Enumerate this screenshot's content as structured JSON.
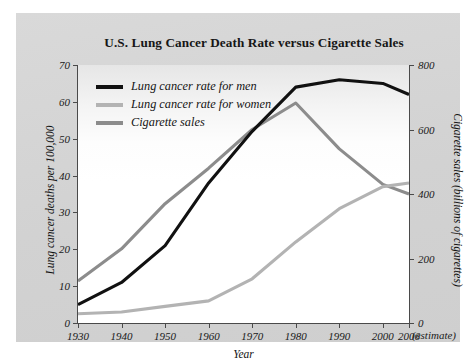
{
  "chart_data": {
    "type": "line",
    "title": "U.S. Lung Cancer Death Rate versus Cigarette Sales",
    "xlabel": "Year",
    "ylabel": "Lung cancer deaths per 100,000",
    "ylabel_right": "Cigarette sales (billions of cigarettes)",
    "x_tick_labels": [
      "1930",
      "1940",
      "1950",
      "1960",
      "1970",
      "1980",
      "1990",
      "2000",
      "2006"
    ],
    "x_estimate_note": "(estimate)",
    "x": [
      1930,
      1940,
      1950,
      1960,
      1970,
      1980,
      1990,
      2000,
      2006
    ],
    "xlim": [
      1930,
      2006
    ],
    "ylim": [
      0,
      70
    ],
    "y_tick_labels": [
      "0",
      "10",
      "20",
      "30",
      "40",
      "50",
      "60",
      "70"
    ],
    "y_ticks": [
      0,
      10,
      20,
      30,
      40,
      50,
      60,
      70
    ],
    "ylim_right": [
      0,
      800
    ],
    "y_right_tick_labels": [
      "0",
      "200",
      "400",
      "600",
      "800"
    ],
    "y_right_ticks": [
      0,
      200,
      400,
      600,
      800
    ],
    "grid": false,
    "legend_position": "upper-left-inside",
    "series": [
      {
        "name": "Lung cancer rate for men",
        "axis": "left",
        "color": "#111111",
        "values": [
          5,
          11,
          21,
          38,
          52,
          64,
          66,
          65,
          62
        ]
      },
      {
        "name": "Lung cancer rate for women",
        "axis": "left",
        "color": "#b3b3b3",
        "values": [
          2.5,
          3,
          4.5,
          6,
          12,
          22,
          31,
          37,
          38
        ]
      },
      {
        "name": "Cigarette sales",
        "axis": "right",
        "color": "#8c8c8c",
        "values": [
          130,
          230,
          370,
          480,
          600,
          682,
          540,
          430,
          400
        ]
      }
    ]
  }
}
